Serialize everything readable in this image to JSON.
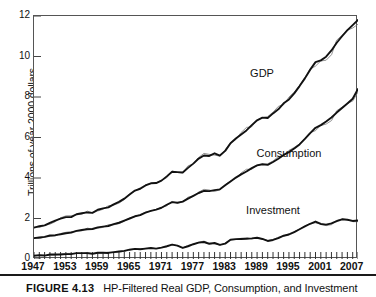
{
  "figure": {
    "caption_number": "FIGURE 4.13",
    "caption_text": "HP-Filtered Real GDP, Consumption, and Investment"
  },
  "chart_data": {
    "type": "line",
    "title": "",
    "xlabel": "",
    "ylabel": "Trillions of year 2000 dollars",
    "xlim": [
      1947,
      2008
    ],
    "ylim": [
      0,
      12
    ],
    "grid": false,
    "legend_position": "inline-annotations",
    "ytick_labels": [
      "0",
      "2",
      "4",
      "6",
      "8",
      "10",
      "12"
    ],
    "ytick_values": [
      0,
      2,
      4,
      6,
      8,
      10,
      12
    ],
    "xtick_labels": [
      "1947",
      "1953",
      "1959",
      "1965",
      "1971",
      "1977",
      "1983",
      "1989",
      "1995",
      "2001",
      "2007"
    ],
    "xtick_values": [
      1947,
      1953,
      1959,
      1965,
      1971,
      1977,
      1983,
      1989,
      1995,
      2001,
      2007
    ],
    "x": [
      1947,
      1948,
      1949,
      1950,
      1951,
      1952,
      1953,
      1954,
      1955,
      1956,
      1957,
      1958,
      1959,
      1960,
      1961,
      1962,
      1963,
      1964,
      1965,
      1966,
      1967,
      1968,
      1969,
      1970,
      1971,
      1972,
      1973,
      1974,
      1975,
      1976,
      1977,
      1978,
      1979,
      1980,
      1981,
      1982,
      1983,
      1984,
      1985,
      1986,
      1987,
      1988,
      1989,
      1990,
      1991,
      1992,
      1993,
      1994,
      1995,
      1996,
      1997,
      1998,
      1999,
      2000,
      2001,
      2002,
      2003,
      2004,
      2005,
      2006,
      2007,
      2008
    ],
    "series": [
      {
        "name": "GDP",
        "annotation": "GDP",
        "values": [
          1.55,
          1.62,
          1.66,
          1.78,
          1.9,
          1.99,
          2.07,
          2.07,
          2.21,
          2.26,
          2.3,
          2.28,
          2.43,
          2.5,
          2.55,
          2.7,
          2.82,
          2.98,
          3.18,
          3.38,
          3.47,
          3.63,
          3.74,
          3.75,
          3.87,
          4.08,
          4.31,
          4.29,
          4.27,
          4.5,
          4.71,
          4.96,
          5.11,
          5.09,
          5.22,
          5.11,
          5.34,
          5.72,
          5.95,
          6.15,
          6.35,
          6.61,
          6.85,
          6.98,
          6.96,
          7.19,
          7.39,
          7.69,
          7.88,
          8.18,
          8.54,
          8.92,
          9.35,
          9.72,
          9.81,
          9.99,
          10.3,
          10.68,
          11.0,
          11.3,
          11.55,
          11.8
        ]
      },
      {
        "name": "Consumption",
        "annotation": "Consumption",
        "values": [
          1.03,
          1.06,
          1.09,
          1.16,
          1.18,
          1.22,
          1.27,
          1.3,
          1.39,
          1.43,
          1.47,
          1.48,
          1.56,
          1.6,
          1.63,
          1.72,
          1.79,
          1.9,
          2.0,
          2.11,
          2.17,
          2.29,
          2.38,
          2.44,
          2.53,
          2.68,
          2.81,
          2.78,
          2.83,
          2.98,
          3.12,
          3.26,
          3.36,
          3.35,
          3.4,
          3.44,
          3.64,
          3.83,
          4.02,
          4.18,
          4.32,
          4.49,
          4.62,
          4.68,
          4.65,
          4.79,
          4.95,
          5.14,
          5.28,
          5.46,
          5.66,
          5.93,
          6.22,
          6.48,
          6.61,
          6.79,
          6.99,
          7.23,
          7.46,
          7.68,
          7.91,
          8.4
        ]
      },
      {
        "name": "Investment",
        "annotation": "Investment",
        "values": [
          0.16,
          0.19,
          0.17,
          0.22,
          0.23,
          0.22,
          0.24,
          0.24,
          0.29,
          0.29,
          0.29,
          0.26,
          0.31,
          0.31,
          0.3,
          0.34,
          0.37,
          0.4,
          0.46,
          0.5,
          0.48,
          0.51,
          0.54,
          0.51,
          0.56,
          0.63,
          0.71,
          0.66,
          0.55,
          0.63,
          0.73,
          0.81,
          0.84,
          0.75,
          0.79,
          0.7,
          0.76,
          0.95,
          0.98,
          0.99,
          1.0,
          1.02,
          1.05,
          0.99,
          0.89,
          0.94,
          1.03,
          1.15,
          1.21,
          1.33,
          1.47,
          1.61,
          1.74,
          1.85,
          1.73,
          1.7,
          1.76,
          1.87,
          1.96,
          1.94,
          1.88,
          1.9
        ]
      }
    ],
    "annotations": [
      {
        "label": "GDP",
        "x_px": 262,
        "y_px": 73
      },
      {
        "label": "Consumption",
        "x_px": 289,
        "y_px": 153
      },
      {
        "label": "Investment",
        "x_px": 273,
        "y_px": 210
      }
    ]
  }
}
